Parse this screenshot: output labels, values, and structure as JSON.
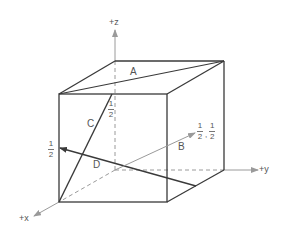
{
  "diagram": {
    "type": "crystallographic-directions-cube",
    "axes": {
      "z": "+z",
      "y": "+y",
      "x": "+x"
    },
    "directions": [
      {
        "label": "A",
        "description": "top face diagonal"
      },
      {
        "label": "B",
        "description": "origin to center of right face",
        "endpoint_label": {
          "num1": "1",
          "den1": "2",
          "sep": ",",
          "num2": "1",
          "den2": "2"
        }
      },
      {
        "label": "C",
        "description": "front bottom-left corner to midpoint of front top edge",
        "endpoint_label": {
          "num": "1",
          "den": "2"
        }
      },
      {
        "label": "D",
        "description": "from right face edge midpoint to left face midpoint",
        "endpoint_label": {
          "num": "1",
          "den": "2"
        }
      }
    ],
    "colors": {
      "edges": "#3a3a3a",
      "axes": "#9a9a9a",
      "text": "#555555"
    }
  }
}
